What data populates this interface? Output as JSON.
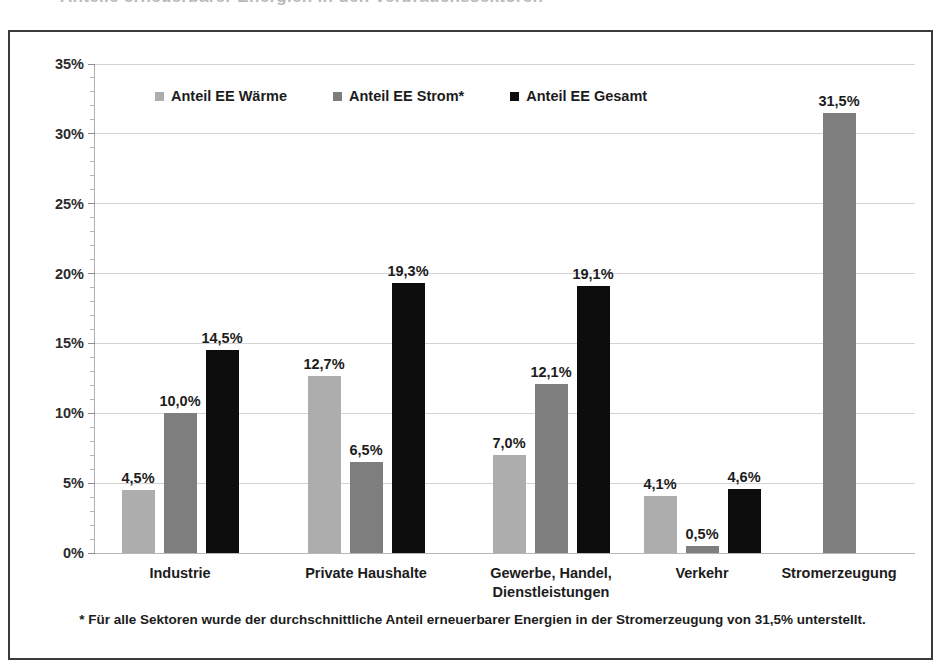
{
  "top_remnant": "Anteile erneuerbarer Energien in den Verbrauchssektoren",
  "colors": {
    "waerme": "#ADADAD",
    "strom": "#7E7E7E",
    "gesamt": "#0D0D0D",
    "grid": "#D3D3D6",
    "frame": "#3A3A3A"
  },
  "legend": {
    "items": [
      {
        "label": "Anteil EE Wärme",
        "color": "#ADADAD",
        "key": "waerme"
      },
      {
        "label": "Anteil EE Strom*",
        "color": "#7E7E7E",
        "key": "strom"
      },
      {
        "label": "Anteil EE Gesamt",
        "color": "#0D0D0D",
        "key": "gesamt"
      }
    ]
  },
  "footnote": "* Für alle Sektoren wurde der durchschnittliche Anteil erneuerbarer Energien in der Stromerzeugung von 31,5% unterstellt.",
  "chart_data": {
    "type": "bar",
    "title": "",
    "xlabel": "",
    "ylabel": "",
    "ylim": [
      0,
      35
    ],
    "ytick_step": 5,
    "yminor_step": 1,
    "grid": true,
    "legend_position": "top-left-inside",
    "value_format": "german-decimal-comma-percent",
    "categories": [
      "Industrie",
      "Private Haushalte",
      "Gewerbe, Handel,\nDienstleistungen",
      "Verkehr",
      "Stromerzeugung"
    ],
    "ytick_labels": [
      "0%",
      "5%",
      "10%",
      "15%",
      "20%",
      "25%",
      "30%",
      "35%"
    ],
    "series": [
      {
        "name": "Anteil EE Wärme",
        "color": "#ADADAD",
        "values": [
          4.5,
          12.7,
          7.0,
          4.1,
          null
        ],
        "labels": [
          "4,5%",
          "12,7%",
          "7,0%",
          "4,1%",
          ""
        ]
      },
      {
        "name": "Anteil EE Strom*",
        "color": "#7E7E7E",
        "values": [
          10.0,
          6.5,
          12.1,
          0.5,
          31.5
        ],
        "labels": [
          "10,0%",
          "6,5%",
          "12,1%",
          "0,5%",
          "31,5%"
        ]
      },
      {
        "name": "Anteil EE Gesamt",
        "color": "#0D0D0D",
        "values": [
          14.5,
          19.3,
          19.1,
          4.6,
          null
        ],
        "labels": [
          "14,5%",
          "19,3%",
          "19,1%",
          "4,6%",
          ""
        ]
      }
    ]
  }
}
